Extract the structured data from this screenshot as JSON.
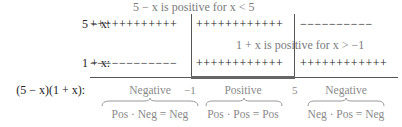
{
  "rows": [
    {
      "label": "5 − x:",
      "signs": [
        "++++++++++++",
        "++++++++++++",
        "−−−−−−−−−−"
      ]
    },
    {
      "label": "1 + x:",
      "signs": [
        "−−−−−−−−−−−−",
        "++++++++++++",
        "++++++++++++"
      ]
    },
    {
      "label": "(5 − x)(1 + x):"
    }
  ],
  "notes": {
    "top": "5 − x is positive for x < 5",
    "middle": "1 + x is positive for x > −1"
  },
  "ticks": [
    "−1",
    "5"
  ],
  "regions": [
    {
      "sign": "Negative",
      "formula": "Pos · Neg = Neg"
    },
    {
      "sign": "Positive",
      "formula": "Pos · Pos = Pos"
    },
    {
      "sign": "Negative",
      "formula": "Neg · Pos = Neg"
    }
  ]
}
